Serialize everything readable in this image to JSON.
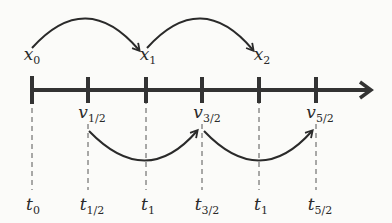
{
  "diagram": {
    "axis": {
      "y": 90,
      "x_start": 32,
      "x_end": 372,
      "color": "#333333"
    },
    "ticks": [
      32,
      88,
      146,
      202,
      259,
      316
    ],
    "positions": [
      {
        "base": "x",
        "sub": "0",
        "x": 32,
        "y": 46
      },
      {
        "base": "x",
        "sub": "1",
        "x": 146,
        "y": 46
      },
      {
        "base": "x",
        "sub": "2",
        "x": 260,
        "y": 46
      }
    ],
    "velocities": [
      {
        "base": "v",
        "sub": "1/2",
        "x": 90,
        "y": 106
      },
      {
        "base": "v",
        "sub": "3/2",
        "x": 204,
        "y": 106
      },
      {
        "base": "v",
        "sub": "5/2",
        "x": 318,
        "y": 106
      }
    ],
    "times": [
      {
        "base": "t",
        "sub": "0",
        "x": 32,
        "y": 196
      },
      {
        "base": "t",
        "sub": "1/2",
        "x": 90,
        "y": 196
      },
      {
        "base": "t",
        "sub": "1",
        "x": 146,
        "y": 196
      },
      {
        "base": "t",
        "sub": "3/2",
        "x": 204,
        "y": 196
      },
      {
        "base": "t",
        "sub": "1",
        "x": 260,
        "y": 196
      },
      {
        "base": "t",
        "sub": "5/2",
        "x": 318,
        "y": 196
      }
    ],
    "top_arcs": [
      {
        "from": 32,
        "to": 140
      },
      {
        "from": 146,
        "to": 254
      }
    ],
    "bottom_arcs": [
      {
        "from": 88,
        "to": 198
      },
      {
        "from": 202,
        "to": 312
      }
    ]
  }
}
